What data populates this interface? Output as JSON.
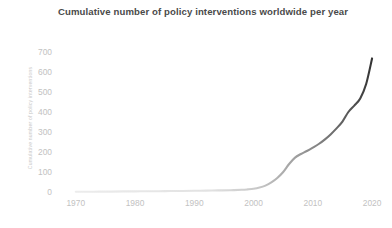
{
  "chart_data": {
    "type": "line",
    "title": "Cumulative number of policy interventions worldwide per year",
    "xlabel": "",
    "ylabel": "Cumulative number of policy interventions",
    "xlim": [
      1967,
      2021
    ],
    "ylim": [
      0,
      740
    ],
    "grid": false,
    "legend": "none",
    "xticks": [
      1970,
      1980,
      1990,
      2000,
      2010,
      2020
    ],
    "yticks": [
      0,
      100,
      200,
      300,
      400,
      500,
      600,
      700
    ],
    "line_color_start": "#e8e8e8",
    "line_color_end": "#3a3a3a",
    "series": [
      {
        "name": "Cumulative policy interventions",
        "x": [
          1970,
          1972,
          1974,
          1976,
          1978,
          1980,
          1982,
          1984,
          1986,
          1988,
          1990,
          1992,
          1994,
          1996,
          1998,
          1999,
          2000,
          2001,
          2002,
          2003,
          2004,
          2005,
          2006,
          2007,
          2008,
          2009,
          2010,
          2011,
          2012,
          2013,
          2014,
          2015,
          2016,
          2017,
          2018,
          2019,
          2020
        ],
        "values": [
          1,
          1,
          2,
          2,
          3,
          3,
          4,
          4,
          5,
          5,
          6,
          7,
          8,
          9,
          11,
          13,
          16,
          22,
          32,
          48,
          70,
          100,
          140,
          172,
          190,
          205,
          222,
          240,
          262,
          288,
          318,
          352,
          400,
          432,
          468,
          540,
          668
        ]
      }
    ]
  },
  "axis": {
    "y_tick_labels": [
      "700",
      "600",
      "500",
      "400",
      "300",
      "200",
      "100",
      "0"
    ],
    "x_tick_labels": [
      "1970",
      "1980",
      "1990",
      "2000",
      "2010",
      "2020"
    ]
  }
}
